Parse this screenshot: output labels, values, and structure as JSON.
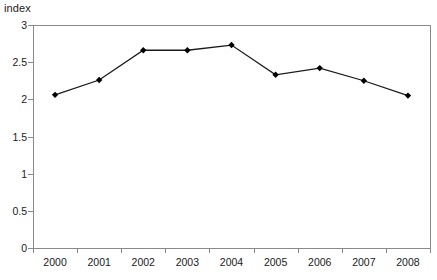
{
  "chart_data": {
    "type": "line",
    "title": "index",
    "xlabel": "",
    "ylabel": "",
    "categories": [
      "2000",
      "2001",
      "2002",
      "2003",
      "2004",
      "2005",
      "2006",
      "2007",
      "2008"
    ],
    "values": [
      2.06,
      2.26,
      2.66,
      2.66,
      2.73,
      2.33,
      2.42,
      2.25,
      2.05
    ],
    "series": [
      {
        "name": "index",
        "values": [
          2.06,
          2.26,
          2.66,
          2.66,
          2.73,
          2.33,
          2.42,
          2.25,
          2.05
        ]
      }
    ],
    "ylim": [
      0,
      3
    ],
    "yticks": [
      "0",
      "0.5",
      "1",
      "1.5",
      "2",
      "2.5",
      "3"
    ],
    "ytick_values": [
      0,
      0.5,
      1,
      1.5,
      2,
      2.5,
      3
    ],
    "xticks": [
      "2000",
      "2001",
      "2002",
      "2003",
      "2004",
      "2005",
      "2006",
      "2007",
      "2008"
    ],
    "grid": false,
    "legend": false,
    "legend_position": "none",
    "marker": "diamond",
    "colors": {
      "line": "#1a1a1a",
      "marker": "#000000",
      "axis": "#8a8a8a",
      "text": "#1a1a1a",
      "background": "#ffffff"
    }
  }
}
